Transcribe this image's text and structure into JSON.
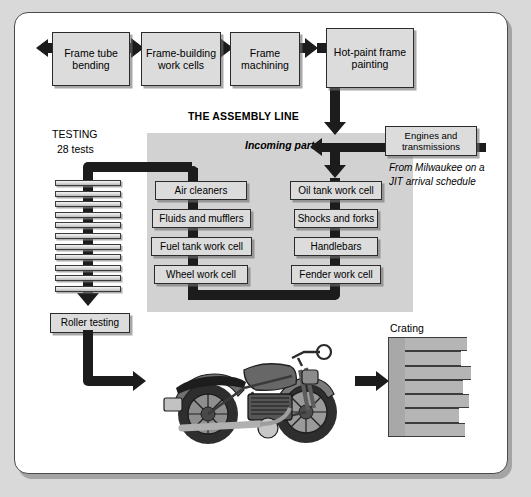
{
  "diagram": {
    "title": "THE ASSEMBLY LINE",
    "top_row": [
      {
        "label": "Frame tube bending"
      },
      {
        "label": "Frame-building work cells"
      },
      {
        "label": "Frame machining"
      },
      {
        "label": "Hot-paint frame painting"
      }
    ],
    "testing": {
      "heading": "TESTING",
      "count_label": "28 tests",
      "bar_count": 11
    },
    "incoming_label": "Incoming parts",
    "engines": {
      "label": "Engines and transmissions",
      "note": "From Milwaukee on a JIT arrival schedule"
    },
    "left_column": [
      {
        "label": "Air cleaners"
      },
      {
        "label": "Fluids and mufflers"
      },
      {
        "label": "Fuel tank work cell"
      },
      {
        "label": "Wheel work cell"
      }
    ],
    "right_column": [
      {
        "label": "Oil tank work cell"
      },
      {
        "label": "Shocks and forks"
      },
      {
        "label": "Handlebars"
      },
      {
        "label": "Fender work cell"
      }
    ],
    "roller_testing": {
      "label": "Roller testing"
    },
    "crating": {
      "label": "Crating",
      "crate_count": 7
    },
    "motorcycle": {
      "name": "finished-motorcycle"
    },
    "colors": {
      "page_background": "#d9d9d9",
      "card_background": "#ffffff",
      "panel_background": "#d2d2d2",
      "box_fill": "#dcdcdc",
      "flow_line": "#1c1c1c",
      "border": "#2b2b2b"
    }
  }
}
